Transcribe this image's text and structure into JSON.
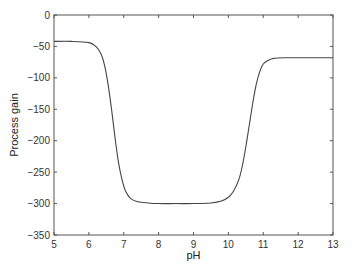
{
  "chart_data": {
    "type": "line",
    "title": "",
    "xlabel": "pH",
    "ylabel": "Process gain",
    "xlim": [
      5,
      13
    ],
    "ylim": [
      -350,
      0
    ],
    "xticks": [
      5,
      6,
      7,
      8,
      9,
      10,
      11,
      12,
      13
    ],
    "yticks": [
      0,
      -50,
      -100,
      -150,
      -200,
      -250,
      -300,
      -350
    ],
    "grid": false,
    "legend": null,
    "series": [
      {
        "name": "Process gain",
        "color": "#444444",
        "x": [
          5.0,
          5.5,
          6.0,
          6.2,
          6.35,
          6.45,
          6.55,
          6.65,
          6.75,
          6.85,
          6.95,
          7.05,
          7.2,
          7.4,
          7.7,
          8.0,
          8.5,
          9.0,
          9.5,
          9.8,
          10.0,
          10.15,
          10.3,
          10.4,
          10.5,
          10.6,
          10.7,
          10.8,
          10.9,
          11.0,
          11.15,
          11.3,
          11.6,
          12.0,
          12.5,
          13.0
        ],
        "y": [
          -42,
          -42,
          -44,
          -50,
          -62,
          -80,
          -110,
          -150,
          -195,
          -235,
          -262,
          -280,
          -292,
          -297,
          -299,
          -300,
          -300,
          -300,
          -299,
          -296,
          -290,
          -280,
          -262,
          -240,
          -210,
          -175,
          -140,
          -110,
          -90,
          -78,
          -72,
          -69,
          -68,
          -68,
          -68,
          -68
        ]
      }
    ]
  }
}
